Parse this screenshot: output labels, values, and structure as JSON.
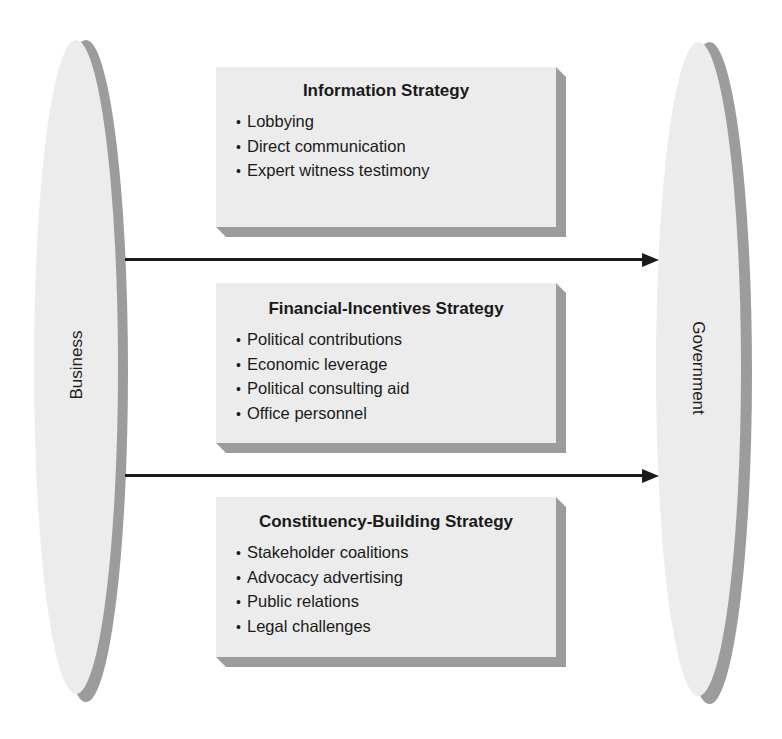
{
  "diagram": {
    "left_entity": {
      "label": "Business"
    },
    "right_entity": {
      "label": "Government"
    },
    "strategies": [
      {
        "title": "Information Strategy",
        "items": [
          "Lobbying",
          "Direct communication",
          "Expert witness testimony"
        ]
      },
      {
        "title": "Financial-Incentives Strategy",
        "items": [
          "Political contributions",
          "Economic leverage",
          "Political consulting aid",
          "Office personnel"
        ]
      },
      {
        "title": "Constituency-Building Strategy",
        "items": [
          "Stakeholder coalitions",
          "Advocacy advertising",
          "Public relations",
          "Legal challenges"
        ]
      }
    ],
    "bullet": "•",
    "arrows": [
      {
        "from": "Business",
        "to": "Government"
      },
      {
        "from": "Business",
        "to": "Government"
      }
    ],
    "colors": {
      "fill": "#ececec",
      "shadow": "#9c9c9c",
      "arrow": "#1a1a1a",
      "text": "#1a1a1a"
    }
  }
}
